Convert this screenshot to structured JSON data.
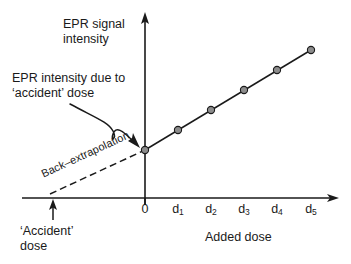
{
  "figure": {
    "background_color": "#ffffff",
    "ink_color": "#1a1a1a",
    "marker_fill_color": "#8c8c8c",
    "y_axis_label": "EPR signal\nintensity",
    "x_axis_label": "Added dose",
    "annotation_label": "EPR intensity due to\n‘accident’ dose",
    "backextrapolation_label": "Back–extrapolation",
    "accident_dose_label": "‘Accident’\ndose",
    "zero_tick_label": "0"
  },
  "chart_data": {
    "type": "scatter",
    "title": "",
    "xlabel": "Added dose",
    "ylabel": "EPR signal intensity",
    "grid": false,
    "legend": "none",
    "x_tick_labels": [
      "0",
      "d1",
      "d2",
      "d3",
      "d4",
      "d5"
    ],
    "x_tick_display": [
      "0",
      "d₁",
      "d₂",
      "d₃",
      "d₄",
      "d₅"
    ],
    "x": [
      0,
      1,
      2,
      3,
      4,
      5
    ],
    "y": [
      1.0,
      1.68,
      2.4,
      3.14,
      3.86,
      4.56
    ],
    "series": [
      {
        "name": "EPR signal vs added dose",
        "x": [
          0,
          1,
          2,
          3,
          4,
          5
        ],
        "values": [
          1.0,
          1.68,
          2.4,
          3.14,
          3.86,
          4.56
        ],
        "marker": "open-circle",
        "line": "solid"
      },
      {
        "name": "Back-extrapolation",
        "x": [
          -1.4,
          0
        ],
        "values": [
          0,
          1.0
        ],
        "marker": "none",
        "line": "dashed"
      }
    ],
    "y_intercept": 1.0,
    "x_intercept": -1.4,
    "annotations": [
      {
        "text": "EPR intensity due to ‘accident’ dose",
        "points_to": [
          0,
          1.0
        ]
      },
      {
        "text": "‘Accident’ dose",
        "points_to": [
          -1.4,
          0
        ]
      },
      {
        "text": "Back–extrapolation",
        "along": "dashed-line"
      }
    ],
    "xlim": [
      -2.1,
      5.9
    ],
    "ylim": [
      0,
      6.1
    ]
  }
}
